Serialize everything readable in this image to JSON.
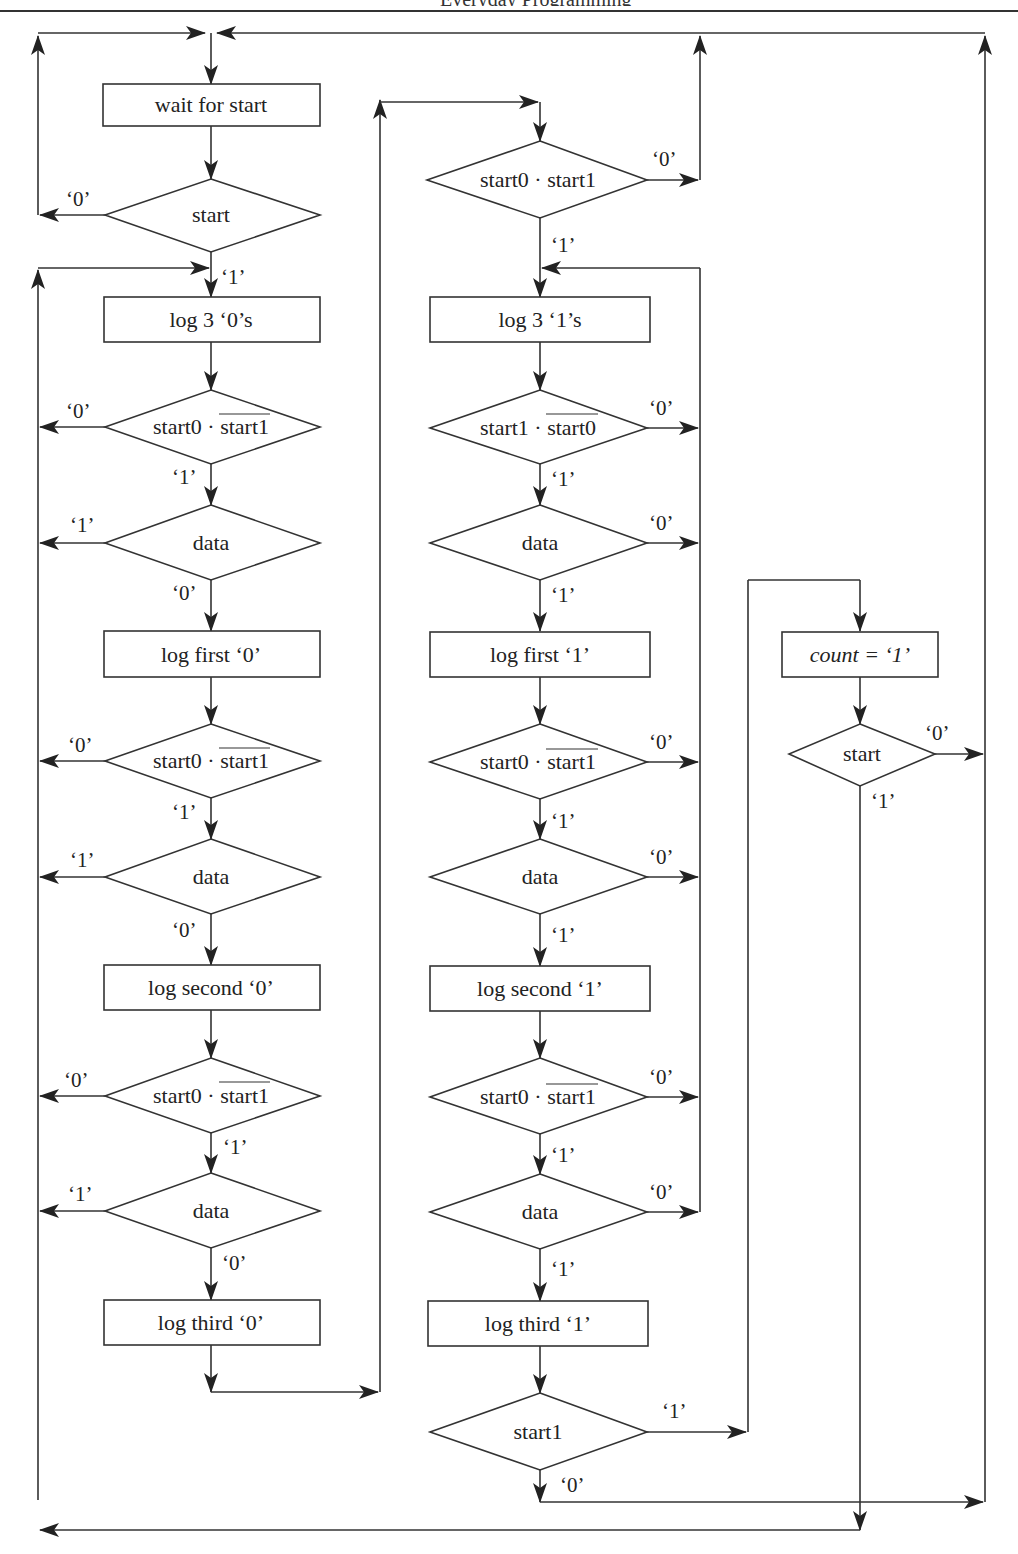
{
  "header": {
    "running_title": "Everyday Programming"
  },
  "colors": {
    "stroke": "#333333",
    "background": "#ffffff",
    "text": "#222222"
  },
  "nodes": {
    "wait_for_start": "wait for start",
    "start_1": "start",
    "log3_0s": "log 3 ‘0’s",
    "c0_d1": {
      "a": "start0 · ",
      "b": "start1"
    },
    "data_a": "data",
    "log_first_0": "log first ‘0’",
    "c0_d2": {
      "a": "start0 · ",
      "b": "start1"
    },
    "data_b": "data",
    "log_second_0": "log second ‘0’",
    "c0_d3": {
      "a": "start0 · ",
      "b": "start1"
    },
    "data_c": "data",
    "log_third_0": "log third ‘0’",
    "c1_top": "start0 · start1",
    "log3_1s": "log 3 ‘1’s",
    "c1_d1": {
      "a": "start1 · ",
      "b": "start0"
    },
    "data_d": "data",
    "log_first_1": "log first ‘1’",
    "c1_d2": {
      "a": "start0 · ",
      "b": "start1"
    },
    "data_e": "data",
    "log_second_1": "log second ‘1’",
    "c1_d3": {
      "a": "start0 · ",
      "b": "start1"
    },
    "data_f": "data",
    "log_third_1": "log third ‘1’",
    "start1_check": "start1",
    "count_box": "count = ‘1’",
    "start_2": "start"
  },
  "labels": {
    "zero": "‘0’",
    "one": "‘1’"
  }
}
